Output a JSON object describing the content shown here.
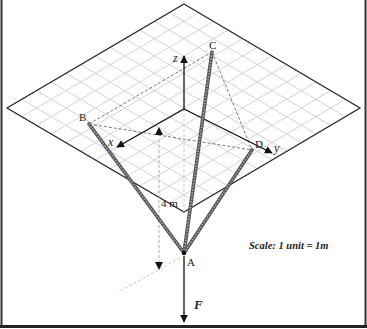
{
  "diagram": {
    "labels": {
      "x_axis": "x",
      "y_axis": "y",
      "z_axis": "z",
      "point_a": "A",
      "point_b": "B",
      "point_c": "C",
      "point_d": "D",
      "force": "F",
      "height_dim": "4 m",
      "scale": "Scale: 1 unit = 1m"
    },
    "colors": {
      "frame": "#2a2a2a",
      "grid": "#cfcfcf",
      "plane_edge": "#2a2a2a",
      "cable": "#555555",
      "cable_core": "#b0b0b0",
      "dashed": "#555555",
      "text": "#222222"
    },
    "grid": {
      "divisions": 12
    },
    "points": {
      "plane_top": [
        184,
        4
      ],
      "plane_right": [
        360,
        108
      ],
      "plane_bottom": [
        184,
        212
      ],
      "plane_left": [
        7,
        108
      ],
      "origin": [
        184,
        109
      ],
      "x_tip": [
        117,
        147
      ],
      "y_tip": [
        272,
        153
      ],
      "z_tip": [
        184,
        56
      ],
      "A": [
        184,
        253
      ],
      "B": [
        89,
        124
      ],
      "C": [
        212,
        52
      ],
      "D": [
        252,
        150
      ],
      "F_end": [
        184,
        322
      ]
    }
  }
}
